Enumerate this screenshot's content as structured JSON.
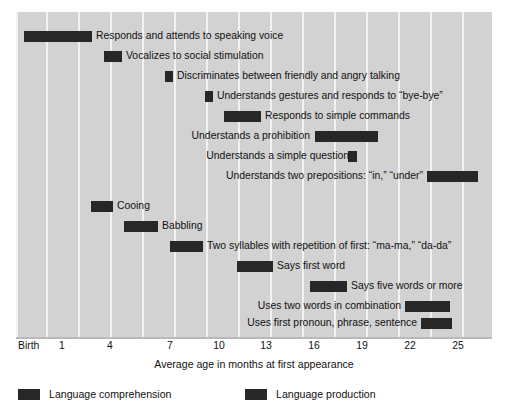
{
  "chart_data": {
    "type": "bar",
    "title": "",
    "subtitle": "",
    "xlabel": "Average age in months at first appearance",
    "ylabel": "",
    "xlim": [
      0,
      27
    ],
    "grid": true,
    "orientation": "horizontal",
    "legend_position": "bottom-left",
    "tick_labels": [
      "Birth",
      "1",
      "4",
      "7",
      "10",
      "13",
      "16",
      "19",
      "22",
      "25"
    ],
    "tick_values": [
      0,
      1,
      4,
      7,
      10,
      13,
      16,
      19,
      22,
      25
    ],
    "legend": [
      {
        "name": "Language comprehension",
        "color": "#272727"
      },
      {
        "name": "Language production",
        "color": "#272727"
      }
    ],
    "series": [
      {
        "name": "Language comprehension",
        "bars": [
          {
            "label": "Responds and attends to speaking voice",
            "start": 0.0,
            "end": 4.3,
            "label_side": "right"
          },
          {
            "label": "Vocalizes to social stimulation",
            "start": 5.0,
            "end": 6.1,
            "label_side": "right"
          },
          {
            "label": "Discriminates between friendly and angry talking",
            "start": 8.8,
            "end": 9.3,
            "label_side": "right"
          },
          {
            "label": "Understands gestures and responds to “bye-bye”",
            "start": 11.3,
            "end": 11.8,
            "label_side": "right"
          },
          {
            "label": "Responds to simple commands",
            "start": 12.5,
            "end": 14.8,
            "label_side": "right"
          },
          {
            "label": "Understands a prohibition",
            "start": 18.1,
            "end": 22.0,
            "label_side": "left"
          },
          {
            "label": "Understands a simple question",
            "start": 20.1,
            "end": 20.7,
            "label_side": "left"
          },
          {
            "label": "Understands two prepositions: “in,” “under”",
            "start": 25.1,
            "end": 28.3,
            "label_side": "left"
          }
        ]
      },
      {
        "name": "Language production",
        "bars": [
          {
            "label": "Cooing",
            "start": 4.2,
            "end": 5.6,
            "label_side": "right"
          },
          {
            "label": "Babbling",
            "start": 6.3,
            "end": 8.4,
            "label_side": "right"
          },
          {
            "label": "Two syllables with repetition of first: “ma-ma,” “da-da”",
            "start": 8.9,
            "end": 11.0,
            "label_side": "right"
          },
          {
            "label": "Says first word",
            "start": 13.1,
            "end": 15.3,
            "label_side": "right"
          },
          {
            "label": "Says five words or more",
            "start": 17.6,
            "end": 19.9,
            "label_side": "right"
          },
          {
            "label": "Uses two words in combination",
            "start": 23.5,
            "end": 26.3,
            "label_side": "left"
          },
          {
            "label": "Uses first pronoun, phrase, sentence",
            "start": 24.5,
            "end": 26.4,
            "label_side": "left"
          }
        ]
      }
    ]
  },
  "rows": [
    {
      "label": "Responds and attends to speaking voice",
      "bar_left": 8,
      "bar_width": 68,
      "label_left": 80,
      "label_side": "right",
      "top": 29
    },
    {
      "label": "Vocalizes to social stimulation",
      "bar_left": 88,
      "bar_width": 18,
      "label_left": 110,
      "label_side": "right",
      "top": 49
    },
    {
      "label": "Discriminates between friendly and angry talking",
      "bar_left": 149,
      "bar_width": 8,
      "label_left": 161,
      "label_side": "right",
      "top": 69
    },
    {
      "label": "Understands gestures and responds to “bye-bye”",
      "bar_left": 189,
      "bar_width": 8,
      "label_left": 201,
      "label_side": "right",
      "top": 89
    },
    {
      "label": "Responds to simple commands",
      "bar_left": 208,
      "bar_width": 37,
      "label_left": 249,
      "label_side": "right",
      "top": 109
    },
    {
      "label": "Understands a prohibition",
      "bar_left": 299,
      "bar_width": 63,
      "label_right": 182,
      "label_side": "left",
      "top": 129
    },
    {
      "label": "Understands a simple question",
      "bar_left": 332,
      "bar_width": 9,
      "label_right": 143,
      "label_side": "left",
      "top": 149
    },
    {
      "label": "Understands two prepositions: “in,” “under”",
      "bar_left": 411,
      "bar_width": 51,
      "label_right": 69,
      "label_side": "left",
      "top": 169
    },
    {
      "label": "Cooing",
      "bar_left": 75,
      "bar_width": 22,
      "label_left": 101,
      "label_side": "right",
      "top": 199
    },
    {
      "label": "Babbling",
      "bar_left": 108,
      "bar_width": 34,
      "label_left": 146,
      "label_side": "right",
      "top": 219
    },
    {
      "label": "Two syllables with repetition of first: “ma-ma,” “da-da”",
      "bar_left": 154,
      "bar_width": 33,
      "label_left": 191,
      "label_side": "right",
      "top": 239
    },
    {
      "label": "Says first word",
      "bar_left": 221,
      "bar_width": 36,
      "label_left": 261,
      "label_side": "right",
      "top": 259
    },
    {
      "label": "Says five words or more",
      "bar_left": 294,
      "bar_width": 37,
      "label_left": 335,
      "label_side": "right",
      "top": 279
    },
    {
      "label": "Uses two words in combination",
      "bar_left": 389,
      "bar_width": 45,
      "label_right": 91,
      "label_side": "left",
      "top": 299
    },
    {
      "label": "Uses first pronoun, phrase, sentence",
      "bar_left": 405,
      "bar_width": 31,
      "label_right": 75,
      "label_side": "left",
      "top": 316
    }
  ],
  "gridlines": [
    16,
    46,
    78,
    110,
    142,
    174,
    206,
    238,
    270,
    302,
    334,
    366,
    398,
    430,
    462
  ],
  "ticks": [
    {
      "label": "Birth",
      "x": 18,
      "birth": true
    },
    {
      "label": "1",
      "x": 62,
      "birth": false
    },
    {
      "label": "4",
      "x": 110,
      "birth": false
    },
    {
      "label": "7",
      "x": 170,
      "birth": false
    },
    {
      "label": "10",
      "x": 219,
      "birth": false
    },
    {
      "label": "13",
      "x": 266,
      "birth": false
    },
    {
      "label": "16",
      "x": 314,
      "birth": false
    },
    {
      "label": "19",
      "x": 362,
      "birth": false
    },
    {
      "label": "22",
      "x": 410,
      "birth": false
    },
    {
      "label": "25",
      "x": 458,
      "birth": false
    }
  ],
  "axis": {
    "title": "Average age in months at first appearance"
  },
  "legend": {
    "items": [
      {
        "label": "Language comprehension",
        "left": 0
      },
      {
        "label": "Language production",
        "left": 227
      }
    ]
  }
}
